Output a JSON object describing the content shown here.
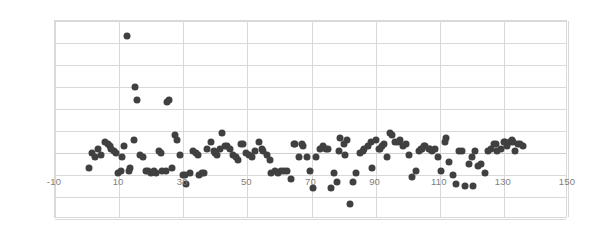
{
  "chart_data": {
    "type": "scatter",
    "title": "",
    "xlabel": "",
    "ylabel": "",
    "xlim": [
      -10,
      150
    ],
    "ylim": [
      -30,
      60
    ],
    "xticks": [
      -10,
      10,
      30,
      50,
      70,
      90,
      110,
      130,
      150
    ],
    "yticks": [
      -30,
      -20,
      -10,
      0,
      10,
      20,
      30,
      40,
      50,
      60
    ],
    "grid": true,
    "legend": false,
    "marker_color": "#404040",
    "marker_size_px": 7,
    "gridline_color": "#d9d9d9",
    "axis_label_color": "#808080",
    "background_color": "#ffffff",
    "series": [
      {
        "name": "residuals",
        "points": [
          [
            0.5,
            -7
          ],
          [
            1.5,
            0
          ],
          [
            2.5,
            -2
          ],
          [
            3.5,
            2
          ],
          [
            4.5,
            -1
          ],
          [
            5.5,
            5
          ],
          [
            6.5,
            4
          ],
          [
            7.0,
            3
          ],
          [
            7.5,
            2
          ],
          [
            8.5,
            1
          ],
          [
            9.0,
            0
          ],
          [
            9.5,
            -9
          ],
          [
            10.5,
            -8
          ],
          [
            11.0,
            -2
          ],
          [
            11.5,
            3
          ],
          [
            12.5,
            53
          ],
          [
            13.0,
            -8
          ],
          [
            13.5,
            -7
          ],
          [
            14.5,
            6
          ],
          [
            15.0,
            30
          ],
          [
            15.5,
            24
          ],
          [
            16.5,
            -1
          ],
          [
            17.5,
            -2
          ],
          [
            18.5,
            -8
          ],
          [
            19.0,
            -8
          ],
          [
            20.0,
            -9
          ],
          [
            21.0,
            -8
          ],
          [
            21.5,
            -9
          ],
          [
            22.5,
            1
          ],
          [
            23.0,
            0
          ],
          [
            23.5,
            -8
          ],
          [
            24.5,
            -8
          ],
          [
            25.0,
            23
          ],
          [
            25.5,
            24
          ],
          [
            26.5,
            -7
          ],
          [
            27.5,
            8
          ],
          [
            28.0,
            6
          ],
          [
            29.0,
            -1
          ],
          [
            30.0,
            -10
          ],
          [
            30.5,
            -10
          ],
          [
            31.0,
            -14
          ],
          [
            32.0,
            -9
          ],
          [
            33.0,
            1
          ],
          [
            34.0,
            0
          ],
          [
            34.5,
            -1
          ],
          [
            35.0,
            -10
          ],
          [
            36.0,
            -9
          ],
          [
            36.5,
            -9
          ],
          [
            37.5,
            2
          ],
          [
            38.5,
            5
          ],
          [
            39.5,
            1
          ],
          [
            40.0,
            0
          ],
          [
            40.5,
            -1
          ],
          [
            41.5,
            2
          ],
          [
            42.0,
            9
          ],
          [
            43.0,
            3
          ],
          [
            43.5,
            3
          ],
          [
            44.5,
            2
          ],
          [
            45.5,
            -1
          ],
          [
            46.5,
            -2
          ],
          [
            47.0,
            -3
          ],
          [
            48.0,
            4
          ],
          [
            48.5,
            4
          ],
          [
            49.5,
            0
          ],
          [
            50.5,
            -1
          ],
          [
            51.5,
            -2
          ],
          [
            52.5,
            1
          ],
          [
            53.5,
            5
          ],
          [
            54.5,
            2
          ],
          [
            55.0,
            1
          ],
          [
            56.0,
            -1
          ],
          [
            57.0,
            -3
          ],
          [
            57.5,
            -9
          ],
          [
            58.5,
            -8
          ],
          [
            59.5,
            -9
          ],
          [
            60.5,
            -8
          ],
          [
            61.5,
            -8
          ],
          [
            62.5,
            -8
          ],
          [
            63.5,
            -12
          ],
          [
            64.5,
            4
          ],
          [
            65.0,
            4
          ],
          [
            66.0,
            -2
          ],
          [
            67.0,
            4
          ],
          [
            67.5,
            3
          ],
          [
            68.5,
            -2
          ],
          [
            69.5,
            -8
          ],
          [
            70.5,
            -16
          ],
          [
            71.5,
            -2
          ],
          [
            72.5,
            2
          ],
          [
            73.5,
            3
          ],
          [
            74.5,
            2
          ],
          [
            75.0,
            2
          ],
          [
            76.0,
            -16
          ],
          [
            77.0,
            -9
          ],
          [
            78.0,
            -13
          ],
          [
            78.5,
            1
          ],
          [
            79.0,
            7
          ],
          [
            80.0,
            4
          ],
          [
            80.5,
            -1
          ],
          [
            81.0,
            6
          ],
          [
            82.0,
            -23
          ],
          [
            83.0,
            -13
          ],
          [
            84.0,
            -9
          ],
          [
            85.0,
            0
          ],
          [
            86.0,
            1
          ],
          [
            86.5,
            2
          ],
          [
            87.5,
            3
          ],
          [
            88.5,
            5
          ],
          [
            89.0,
            -7
          ],
          [
            90.0,
            6
          ],
          [
            91.0,
            2
          ],
          [
            91.5,
            2
          ],
          [
            92.0,
            3
          ],
          [
            92.5,
            4
          ],
          [
            93.5,
            -2
          ],
          [
            94.5,
            9
          ],
          [
            95.0,
            8
          ],
          [
            96.0,
            5
          ],
          [
            97.0,
            5
          ],
          [
            97.5,
            6
          ],
          [
            98.5,
            3
          ],
          [
            99.5,
            4
          ],
          [
            100.5,
            -1
          ],
          [
            101.5,
            -11
          ],
          [
            102.5,
            -8
          ],
          [
            103.5,
            1
          ],
          [
            104.0,
            2
          ],
          [
            104.5,
            2
          ],
          [
            105.0,
            3
          ],
          [
            105.5,
            3
          ],
          [
            106.5,
            2
          ],
          [
            107.0,
            2
          ],
          [
            107.5,
            1
          ],
          [
            108.5,
            2
          ],
          [
            109.5,
            -2
          ],
          [
            110.5,
            -8
          ],
          [
            111.5,
            5
          ],
          [
            112.0,
            7
          ],
          [
            113.0,
            -4
          ],
          [
            114.0,
            -10
          ],
          [
            115.0,
            -14
          ],
          [
            116.0,
            1
          ],
          [
            117.0,
            1
          ],
          [
            118.0,
            -15
          ],
          [
            119.0,
            -5
          ],
          [
            120.0,
            -2
          ],
          [
            120.5,
            -15
          ],
          [
            121.0,
            1
          ],
          [
            122.0,
            -6
          ],
          [
            123.0,
            -5
          ],
          [
            124.0,
            -9
          ],
          [
            125.0,
            1
          ],
          [
            126.0,
            2
          ],
          [
            127.0,
            4
          ],
          [
            127.5,
            4
          ],
          [
            128.0,
            1
          ],
          [
            129.0,
            2
          ],
          [
            130.0,
            5
          ],
          [
            130.5,
            5
          ],
          [
            131.0,
            3
          ],
          [
            132.0,
            5
          ],
          [
            132.5,
            6
          ],
          [
            133.0,
            5
          ],
          [
            133.5,
            1
          ],
          [
            134.5,
            4
          ],
          [
            135.0,
            4
          ],
          [
            136.0,
            3
          ]
        ]
      }
    ]
  }
}
